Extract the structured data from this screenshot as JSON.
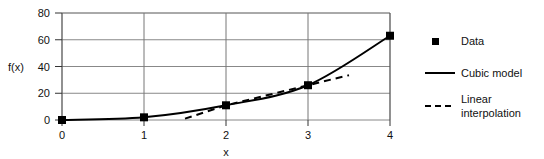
{
  "chart_data": {
    "type": "line",
    "title": "",
    "xlabel": "x",
    "ylabel": "f(x)",
    "xlim": [
      0,
      4
    ],
    "ylim": [
      0,
      80
    ],
    "xticks": [
      "0",
      "1",
      "2",
      "3",
      "4"
    ],
    "yticks": [
      "0",
      "20",
      "40",
      "60",
      "80"
    ],
    "grid": true,
    "legend_position": "right",
    "x": [
      0,
      1,
      2,
      3,
      4
    ],
    "series": [
      {
        "name": "Data",
        "style": "markers",
        "marker": "square",
        "color": "#000000",
        "values": [
          0,
          2,
          11,
          26,
          63
        ]
      },
      {
        "name": "Cubic model",
        "style": "solid",
        "color": "#000000",
        "values": [
          0,
          2,
          11,
          26,
          63
        ]
      },
      {
        "name": "Linear interpolation",
        "style": "dashed",
        "color": "#000000",
        "x": [
          1.5,
          2,
          3,
          3.5
        ],
        "values": [
          1.0,
          11,
          26,
          33.5
        ]
      }
    ]
  },
  "axes": {
    "ylabel": "f(x)",
    "xlabel": "x",
    "yticks": [
      {
        "label": "80",
        "value": 80
      },
      {
        "label": "60",
        "value": 60
      },
      {
        "label": "40",
        "value": 40
      },
      {
        "label": "20",
        "value": 20
      },
      {
        "label": "0",
        "value": 0
      }
    ],
    "xticks": [
      {
        "label": "0",
        "value": 0
      },
      {
        "label": "1",
        "value": 1
      },
      {
        "label": "2",
        "value": 2
      },
      {
        "label": "3",
        "value": 3
      },
      {
        "label": "4",
        "value": 4
      }
    ]
  },
  "legend": {
    "entries": [
      {
        "label": "Data",
        "swatch": "square-marker"
      },
      {
        "label": "Cubic model",
        "swatch": "solid-line"
      },
      {
        "label": "Linear interpolation",
        "swatch": "dashed-line"
      }
    ]
  }
}
